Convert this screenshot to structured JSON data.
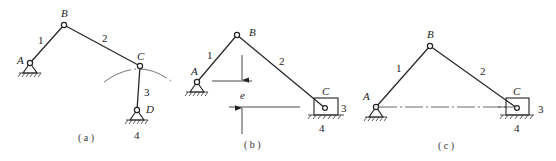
{
  "figures": [
    {
      "id": "a",
      "caption": "( a )",
      "joints": {
        "A": "A",
        "B": "B",
        "C": "C",
        "D": "D"
      },
      "links": {
        "crank": "1",
        "coupler": "2",
        "rocker": "3",
        "frame": "4"
      }
    },
    {
      "id": "b",
      "caption": "( b )",
      "joints": {
        "A": "A",
        "B": "B",
        "C": "C"
      },
      "links": {
        "crank": "1",
        "coupler": "2",
        "slider": "3",
        "frame": "4"
      },
      "offset_label": "e"
    },
    {
      "id": "c",
      "caption": "( c )",
      "joints": {
        "A": "A",
        "B": "B",
        "C": "C"
      },
      "links": {
        "crank": "1",
        "coupler": "2",
        "slider": "3",
        "frame": "4"
      }
    }
  ]
}
